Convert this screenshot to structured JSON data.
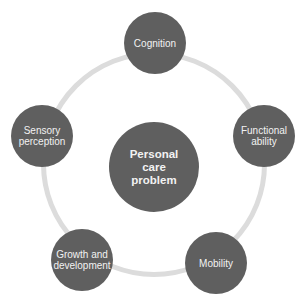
{
  "diagram": {
    "type": "hub-and-ring",
    "center": {
      "label": "Personal care problem"
    },
    "nodes": [
      {
        "id": "cognition",
        "label": "Cognition"
      },
      {
        "id": "functional-ability",
        "label": "Functional ability"
      },
      {
        "id": "mobility",
        "label": "Mobility"
      },
      {
        "id": "growth-and-development",
        "label": "Growth and development"
      },
      {
        "id": "sensory-perception",
        "label": "Sensory perception"
      }
    ],
    "colors": {
      "node_fill": "#5f5f5f",
      "node_text": "#f2f2f2",
      "ring": "#dcdcdc",
      "background": "#ffffff"
    }
  }
}
